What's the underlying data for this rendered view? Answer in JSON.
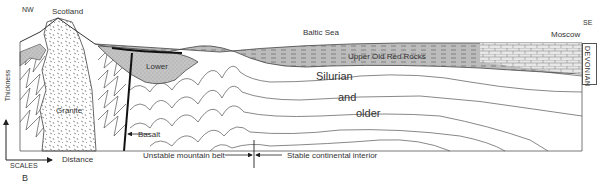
{
  "figure": {
    "panel_label": "B",
    "directions": {
      "left": "NW",
      "right": "SE"
    },
    "places": {
      "scotland": "Scotland",
      "baltic_sea": "Baltic Sea",
      "moscow": "Moscow"
    },
    "units": {
      "upper_old_red": "Upper Old Red Rocks",
      "lower": "Lower",
      "silurian": "Silurian",
      "and": "and",
      "older": "older",
      "granite": "Granite",
      "basalt": "Basalt",
      "devonian": "DEVONIAN"
    },
    "scales": {
      "title": "SCALES",
      "x_axis": "Distance",
      "y_axis": "Thickness"
    },
    "zones": {
      "unstable": "Unstable mountain belt",
      "stable": "Stable continental interior"
    },
    "colors": {
      "stipple_fill": "#bdbdbd",
      "line": "#444444",
      "background": "#ffffff"
    }
  }
}
